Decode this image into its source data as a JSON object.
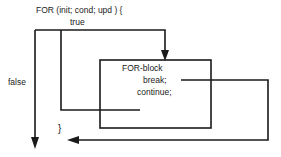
{
  "diagram": {
    "colors": {
      "stroke": "#1a1a1a",
      "text": "#1a1a1a",
      "background": "#ffffff"
    },
    "labels": {
      "for_header": "FOR (init; cond; upd ) {",
      "true_branch": "true",
      "false_branch": "false",
      "block_title": "FOR-block",
      "break_statement": "break;",
      "continue_statement": "continue;",
      "close_brace": "}"
    },
    "nodes": [
      {
        "name": "for-block-box",
        "x": 100,
        "y": 60,
        "width": 111,
        "height": 68
      }
    ],
    "edges": [
      {
        "name": "true-edge",
        "from": "for-header",
        "to": "for-block-box",
        "arrow": true
      },
      {
        "name": "false-edge",
        "from": "for-header",
        "to": "loop-exit",
        "arrow": true
      },
      {
        "name": "break-edge",
        "from": "break-statement",
        "to": "loop-exit",
        "arrow": true
      },
      {
        "name": "continue-edge",
        "from": "continue-statement",
        "to": "for-header",
        "arrow": false
      }
    ]
  }
}
